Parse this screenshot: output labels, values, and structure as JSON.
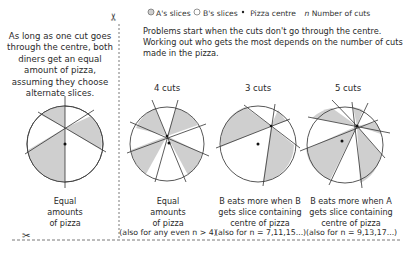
{
  "legend": {
    "a_slices": "A's slices",
    "b_slices": "B's slices",
    "pizza_centre": "Pizza centre",
    "n_symbol": "n",
    "n_label": "Number of cuts",
    "colors": {
      "a_fill": "#cfcfcf",
      "b_fill": "#ffffff",
      "stroke": "#444444"
    }
  },
  "left_panel": {
    "intro": "As long as one cut goes through the centre, both diners get an equal amount of pizza, assuming they choose alternate slices.",
    "caption_line1": "Equal",
    "caption_line2": "amounts",
    "caption_line3": "of pizza"
  },
  "right_panel": {
    "intro": "Problems start when the cuts don't go through the centre. Working out who gets the most depends on the number of cuts made in the pizza.",
    "panels": [
      {
        "heading": "4 cuts",
        "caption_line1": "Equal",
        "caption_line2": "amounts",
        "caption_line3": "of pizza",
        "caption_line4": "(also for any even n > 4)"
      },
      {
        "heading": "3 cuts",
        "caption_line1": "B eats more when B",
        "caption_line2": "gets slice containing",
        "caption_line3": "centre of pizza",
        "caption_line4": "(also for n = 7,11,15...)"
      },
      {
        "heading": "5 cuts",
        "caption_line1": "B eats more when A",
        "caption_line2": "gets slice containing",
        "caption_line3": "centre of pizza",
        "caption_line4": "(also for n = 9,13,17...)"
      }
    ]
  },
  "decor": {
    "scissors_glyph": "✂"
  }
}
